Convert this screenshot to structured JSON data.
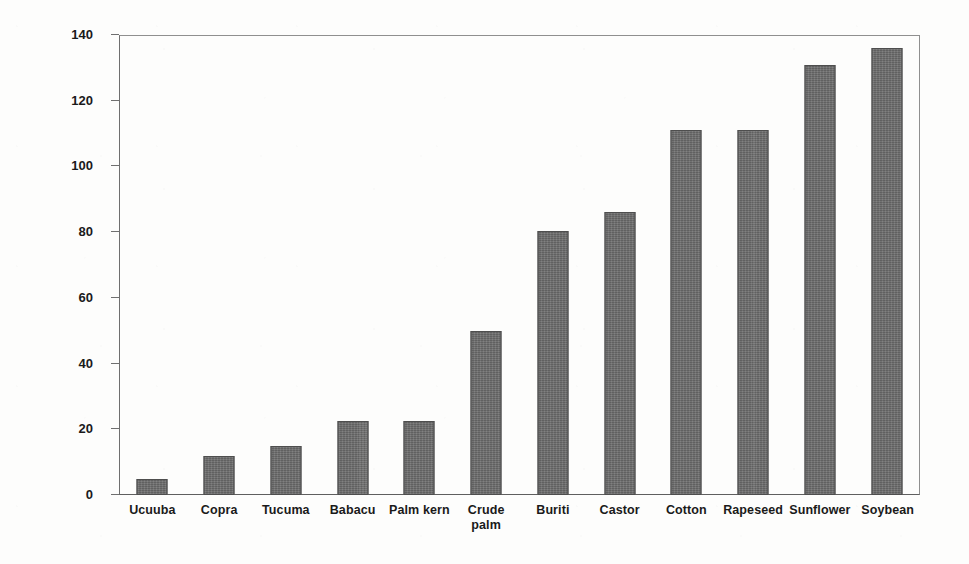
{
  "chart_data": {
    "type": "bar",
    "title": "",
    "subtitle": "",
    "xlabel": "",
    "ylabel": "Iodine Index",
    "ylim": [
      0,
      140
    ],
    "ytick_step": 20,
    "yticks": [
      0,
      20,
      40,
      60,
      80,
      100,
      120,
      140
    ],
    "grid": false,
    "legend": "none",
    "bar_color": "#6a6a6a",
    "bar_edge_color": "#4e4e4e",
    "axis_color": "#6f6f6f",
    "categories": [
      "Ucuuba",
      "Copra",
      "Tucuma",
      "Babacu",
      "Palm kern",
      "Crude palm",
      "Buriti",
      "Castor",
      "Cotton",
      "Rapeseed",
      "Sunflower",
      "Soybean"
    ],
    "category_lines": [
      [
        "Ucuuba"
      ],
      [
        "Copra"
      ],
      [
        "Tucuma"
      ],
      [
        "Babacu"
      ],
      [
        "Palm kern"
      ],
      [
        "Crude",
        "palm"
      ],
      [
        "Buriti"
      ],
      [
        "Castor"
      ],
      [
        "Cotton"
      ],
      [
        "Rapeseed"
      ],
      [
        "Sunflower"
      ],
      [
        "Soybean"
      ]
    ],
    "values": [
      5,
      12,
      15,
      22.5,
      22.5,
      50,
      80.5,
      86,
      111,
      111,
      131,
      136
    ],
    "series": [
      {
        "name": "Iodine Index",
        "values": [
          5,
          12,
          15,
          22.5,
          22.5,
          50,
          80.5,
          86,
          111,
          111,
          131,
          136
        ]
      }
    ]
  },
  "ytick_labels": {
    "t0": "0",
    "t1": "20",
    "t2": "40",
    "t3": "60",
    "t4": "80",
    "t5": "100",
    "t6": "120",
    "t7": "140"
  },
  "axis": {
    "y_title": "Iodine Index"
  },
  "labels": {
    "c0a": "Ucuuba",
    "c1a": "Copra",
    "c2a": "Tucuma",
    "c3a": "Babacu",
    "c4a": "Palm kern",
    "c5a": "Crude",
    "c5b": "palm",
    "c6a": "Buriti",
    "c7a": "Castor",
    "c8a": "Cotton",
    "c9a": "Rapeseed",
    "c10a": "Sunflower",
    "c11a": "Soybean"
  }
}
